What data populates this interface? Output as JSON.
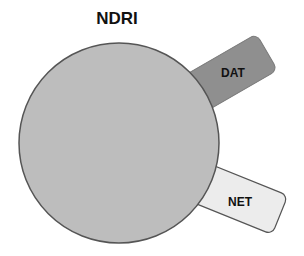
{
  "title": "NDRI",
  "shapes": {
    "circle": {
      "label": "NDRI",
      "fill": "#bdbdbd",
      "stroke": "#555555"
    },
    "dat": {
      "label": "DAT",
      "fill": "#8f8f8f",
      "stroke": "#6f6f6f"
    },
    "net": {
      "label": "NET",
      "fill": "#ececec",
      "stroke": "#555555"
    }
  }
}
